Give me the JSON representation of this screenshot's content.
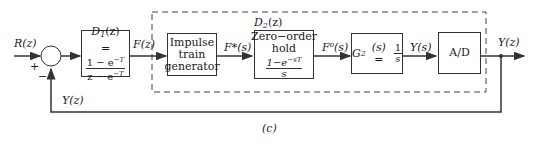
{
  "diagram": {
    "caption": "(c)",
    "colors": {
      "line": "#333333",
      "background": "#ffffff"
    },
    "signals": {
      "input": "R(z)",
      "f_z": "F(z)",
      "f_star": "F*(s)",
      "f_zero": "F⁰(s)",
      "y_s": "Y(s)",
      "output": "Y(z)",
      "feedback": "Y(z)"
    },
    "summing_junction": {
      "plus": "+",
      "minus": "−"
    },
    "blocks": {
      "d1": {
        "title_main": "D",
        "title_sub": "1",
        "title_arg": "(z)",
        "eq": "=",
        "num": "1 − e",
        "num_sup": "−T",
        "den": "z − e",
        "den_sup": "−T"
      },
      "impulse": {
        "line1": "Impulse",
        "line2": "train",
        "line3": "generator"
      },
      "zoh": {
        "line1": "Zero−order",
        "line2": "hold",
        "num": "1−e",
        "num_sup": "−sT",
        "den": "s"
      },
      "g2": {
        "main": "G",
        "sub": "2",
        "arg": "(s) =",
        "num": "1",
        "den": "s"
      },
      "ad": {
        "label": "A/D"
      }
    },
    "group": {
      "label_main": "D",
      "label_sub": "2",
      "label_arg": "(z)"
    }
  }
}
